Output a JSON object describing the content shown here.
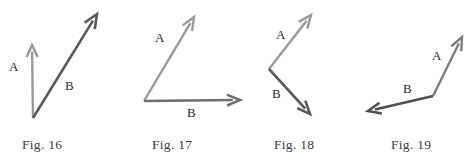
{
  "sheet": {
    "width": 475,
    "height": 159,
    "background": "#ffffff",
    "title": "Vector angle figures 16 through 19"
  },
  "colors": {
    "light_arrow": "#9a9a9a",
    "mid_arrow": "#7d7d7d",
    "dark_arrow": "#595959",
    "label_text": "#2a2a2a",
    "caption_text": "#3a3a3a"
  },
  "figures": [
    {
      "id": "fig-16",
      "caption": "Fig. 16",
      "caption_x": 22,
      "caption_y": 138,
      "panel_left": 0,
      "panel_width": 120,
      "vectors": [
        {
          "name": "A",
          "label": "A",
          "label_x": 9,
          "label_y": 60,
          "color": "#9a9a9a",
          "width": 2.4,
          "x1": 33,
          "y1": 118,
          "x2": 32,
          "y2": 45,
          "head_len": 12,
          "head_half": 5.5
        },
        {
          "name": "B",
          "label": "B",
          "label_x": 65,
          "label_y": 79,
          "color": "#595959",
          "width": 2.6,
          "x1": 33,
          "y1": 118,
          "x2": 97,
          "y2": 14,
          "head_len": 14,
          "head_half": 6
        }
      ]
    },
    {
      "id": "fig-17",
      "caption": "Fig. 17",
      "caption_x": 152,
      "caption_y": 138,
      "panel_left": 120,
      "panel_width": 130,
      "vectors": [
        {
          "name": "A",
          "label": "A",
          "label_x": 155,
          "label_y": 31,
          "color": "#9a9a9a",
          "width": 2.4,
          "x1": 144,
          "y1": 101,
          "x2": 194,
          "y2": 17,
          "head_len": 13,
          "head_half": 5.5
        },
        {
          "name": "B",
          "label": "B",
          "label_x": 187,
          "label_y": 106,
          "color": "#6e6e6e",
          "width": 2.6,
          "x1": 144,
          "y1": 101,
          "x2": 240,
          "y2": 100,
          "head_len": 13,
          "head_half": 5.5
        }
      ]
    },
    {
      "id": "fig-18",
      "caption": "Fig. 18",
      "caption_x": 274,
      "caption_y": 138,
      "panel_left": 250,
      "panel_width": 110,
      "vectors": [
        {
          "name": "A",
          "label": "A",
          "label_x": 276,
          "label_y": 28,
          "color": "#9a9a9a",
          "width": 2.4,
          "x1": 269,
          "y1": 69,
          "x2": 311,
          "y2": 15,
          "head_len": 13,
          "head_half": 5.5
        },
        {
          "name": "B",
          "label": "B",
          "label_x": 272,
          "label_y": 87,
          "color": "#595959",
          "width": 2.6,
          "x1": 269,
          "y1": 69,
          "x2": 310,
          "y2": 114,
          "head_len": 13,
          "head_half": 5.5
        }
      ]
    },
    {
      "id": "fig-19",
      "caption": "Fig. 19",
      "caption_x": 391,
      "caption_y": 138,
      "panel_left": 360,
      "panel_width": 115,
      "vectors": [
        {
          "name": "A",
          "label": "A",
          "label_x": 432,
          "label_y": 49,
          "color": "#7d7d7d",
          "width": 2.4,
          "x1": 433,
          "y1": 96,
          "x2": 462,
          "y2": 37,
          "head_len": 13,
          "head_half": 5.5
        },
        {
          "name": "B",
          "label": "B",
          "label_x": 403,
          "label_y": 82,
          "color": "#4f4f4f",
          "width": 2.6,
          "x1": 433,
          "y1": 96,
          "x2": 368,
          "y2": 111,
          "head_len": 13,
          "head_half": 5.5
        }
      ]
    }
  ]
}
